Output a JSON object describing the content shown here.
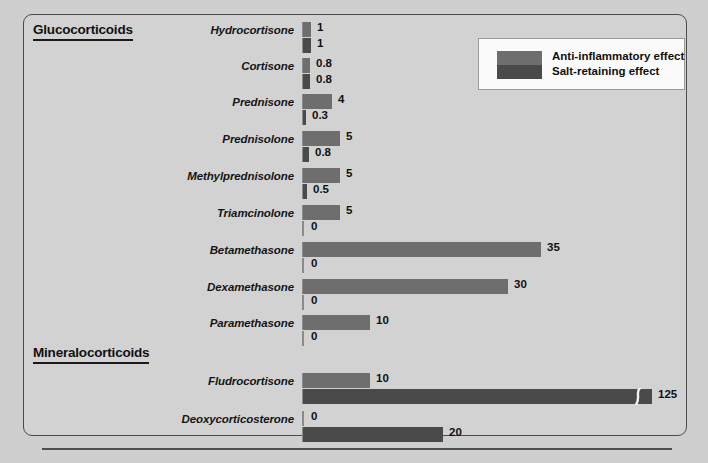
{
  "sections": [
    {
      "id": "gluco",
      "title": "Glucocorticoids"
    },
    {
      "id": "mineralo",
      "title": "Mineralocorticoids"
    }
  ],
  "legend": {
    "items": [
      {
        "label": "Anti-inflammatory effect",
        "color": "#6e6e6e",
        "key": "anti"
      },
      {
        "label": "Salt-retaining effect",
        "color": "#4a4a4a",
        "key": "salt"
      }
    ]
  },
  "chart_data": {
    "type": "bar",
    "title": "",
    "xlabel": "",
    "ylabel": "",
    "orientation": "horizontal",
    "grid": false,
    "legend_position": "top-right",
    "xlim": [
      0,
      125
    ],
    "axis_break": {
      "present": true,
      "series": "Salt-retaining effect",
      "category": "Fludrocortisone"
    },
    "categories": [
      "Hydrocortisone",
      "Cortisone",
      "Prednisone",
      "Prednisolone",
      "Methylprednisolone",
      "Triamcinolone",
      "Betamethasone",
      "Dexamethasone",
      "Paramethasone",
      "Fludrocortisone",
      "Deoxycorticosterone"
    ],
    "groups": [
      {
        "name": "Glucocorticoids",
        "categories": [
          "Hydrocortisone",
          "Cortisone",
          "Prednisone",
          "Prednisolone",
          "Methylprednisolone",
          "Triamcinolone",
          "Betamethasone",
          "Dexamethasone",
          "Paramethasone"
        ]
      },
      {
        "name": "Mineralocorticoids",
        "categories": [
          "Fludrocortisone",
          "Deoxycorticosterone"
        ]
      }
    ],
    "series": [
      {
        "name": "Anti-inflammatory effect",
        "color": "#6e6e6e",
        "values": [
          1,
          0.8,
          4,
          5,
          5,
          5,
          35,
          30,
          10,
          10,
          0
        ],
        "labels": [
          "1",
          "0.8",
          "4",
          "5",
          "5",
          "5",
          "35",
          "30",
          "10",
          "10",
          "0"
        ]
      },
      {
        "name": "Salt-retaining effect",
        "color": "#4a4a4a",
        "values": [
          1,
          0.8,
          0.3,
          0.8,
          0.5,
          0,
          0,
          0,
          0,
          125,
          20
        ],
        "labels": [
          "1",
          "0.8",
          "0.3",
          "0.8",
          "0.5",
          "0",
          "0",
          "0",
          "0",
          "125",
          "20"
        ]
      }
    ]
  },
  "rows": [
    {
      "name": "Hydrocortisone",
      "section": "gluco",
      "top": 22,
      "anti": {
        "value": 1,
        "label": "1",
        "px": 8
      },
      "salt": {
        "value": 1,
        "label": "1",
        "px": 8
      }
    },
    {
      "name": "Cortisone",
      "section": "gluco",
      "top": 58,
      "anti": {
        "value": 0.8,
        "label": "0.8",
        "px": 7
      },
      "salt": {
        "value": 0.8,
        "label": "0.8",
        "px": 7
      }
    },
    {
      "name": "Prednisone",
      "section": "gluco",
      "top": 94,
      "anti": {
        "value": 4,
        "label": "4",
        "px": 29
      },
      "salt": {
        "value": 0.3,
        "label": "0.3",
        "px": 3
      }
    },
    {
      "name": "Prednisolone",
      "section": "gluco",
      "top": 131,
      "anti": {
        "value": 5,
        "label": "5",
        "px": 37
      },
      "salt": {
        "value": 0.8,
        "label": "0.8",
        "px": 6
      }
    },
    {
      "name": "Methylprednisolone",
      "section": "gluco",
      "top": 168,
      "anti": {
        "value": 5,
        "label": "5",
        "px": 37
      },
      "salt": {
        "value": 0.5,
        "label": "0.5",
        "px": 4
      }
    },
    {
      "name": "Triamcinolone",
      "section": "gluco",
      "top": 205,
      "anti": {
        "value": 5,
        "label": "5",
        "px": 37
      },
      "salt": {
        "value": 0,
        "label": "0",
        "px": 0
      }
    },
    {
      "name": "Betamethasone",
      "section": "gluco",
      "top": 242,
      "anti": {
        "value": 35,
        "label": "35",
        "px": 238
      },
      "salt": {
        "value": 0,
        "label": "0",
        "px": 0
      }
    },
    {
      "name": "Dexamethasone",
      "section": "gluco",
      "top": 279,
      "anti": {
        "value": 30,
        "label": "30",
        "px": 205
      },
      "salt": {
        "value": 0,
        "label": "0",
        "px": 0
      }
    },
    {
      "name": "Paramethasone",
      "section": "gluco",
      "top": 315,
      "anti": {
        "value": 10,
        "label": "10",
        "px": 67
      },
      "salt": {
        "value": 0,
        "label": "0",
        "px": 0
      }
    },
    {
      "name": "Fludrocortisone",
      "section": "mineralo",
      "top": 373,
      "anti": {
        "value": 10,
        "label": "10",
        "px": 67
      },
      "salt": {
        "value": 125,
        "label": "125",
        "px": 349,
        "break_at": 329
      }
    },
    {
      "name": "Deoxycorticosterone",
      "section": "mineralo",
      "top": 411,
      "anti": {
        "value": 0,
        "label": "0",
        "px": 0
      },
      "salt": {
        "value": 20,
        "label": "20",
        "px": 140
      }
    }
  ]
}
